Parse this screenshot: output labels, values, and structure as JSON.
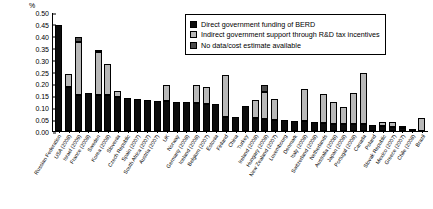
{
  "chart_data": {
    "type": "bar",
    "title": "",
    "xlabel": "",
    "ylabel": "%",
    "ylim": [
      0.0,
      0.5
    ],
    "ytick_labels": [
      "0.50",
      "0.45",
      "0.40",
      "0.35",
      "0.30",
      "0.25",
      "0.20",
      "0.15",
      "0.10",
      "0.05",
      "0.00"
    ],
    "ytick_values": [
      0.5,
      0.45,
      0.4,
      0.35,
      0.3,
      0.25,
      0.2,
      0.15,
      0.1,
      0.05,
      0.0
    ],
    "grid": false,
    "stacked": true,
    "legend_position": "top-right-inside",
    "categories": [
      "Russian Federation",
      "USA (2008)",
      "Israel (2009)",
      "France (2008)",
      "Sweden",
      "Korea (2008)",
      "Slovenia",
      "Czech Republic",
      "Spain (2007)",
      "South Africa (2007)",
      "Austria (2007)",
      "UK",
      "Norway",
      "Germany (2008)",
      "Iceland (2008)",
      "Belgium (2007)",
      "Estonia",
      "Finland",
      "China",
      "Turkey",
      "Ireland (2008)",
      "Hungary (2008)",
      "New Zealand (2007)",
      "Luxembourg",
      "Denmark",
      "Italy (2008)",
      "Switzerland (2008)",
      "Netherlands",
      "Australia (2008)",
      "Japan (2008)",
      "Portugal (2008)",
      "Canada",
      "Poland",
      "Slovak Republic",
      "Mexico (2007)",
      "Greece (2007)",
      "Chile (2008)",
      "Brazil"
    ],
    "series": [
      {
        "name": "Direct government funding of BERD",
        "color": "#0d0d0d",
        "values": [
          0.445,
          0.185,
          0.15,
          0.16,
          0.15,
          0.15,
          0.145,
          0.14,
          0.135,
          0.13,
          0.128,
          0.125,
          0.122,
          0.12,
          0.118,
          0.115,
          0.112,
          0.06,
          0.058,
          0.105,
          0.055,
          0.05,
          0.045,
          0.045,
          0.042,
          0.04,
          0.038,
          0.035,
          0.03,
          0.028,
          0.03,
          0.03,
          0.025,
          0.022,
          0.018,
          0.012,
          0.01,
          0.0
        ]
      },
      {
        "name": "Indirect government support through R&D tax incentives",
        "color": "#b8b8b8",
        "values": [
          0.0,
          0.055,
          0.225,
          0.0,
          0.18,
          0.13,
          0.025,
          0.0,
          0.0,
          0.0,
          0.0,
          0.07,
          0.0,
          0.0,
          0.075,
          0.07,
          0.0,
          0.175,
          0.0,
          0.0,
          0.075,
          0.115,
          0.09,
          0.0,
          0.0,
          0.135,
          0.0,
          0.12,
          0.09,
          0.075,
          0.13,
          0.215,
          0.0,
          0.015,
          0.02,
          0.01,
          0.0,
          0.055
        ]
      },
      {
        "name": "No data/cost estimate available",
        "color": "#4d4d4d",
        "values": [
          0.0,
          0.0,
          0.018,
          0.0,
          0.012,
          0.0,
          0.0,
          0.0,
          0.0,
          0.0,
          0.0,
          0.0,
          0.0,
          0.0,
          0.0,
          0.0,
          0.0,
          0.0,
          0.0,
          0.0,
          0.0,
          0.03,
          0.0,
          0.0,
          0.0,
          0.0,
          0.0,
          0.0,
          0.0,
          0.0,
          0.0,
          0.0,
          0.0,
          0.0,
          0.0,
          0.0,
          0.0,
          0.0
        ]
      }
    ]
  },
  "legend": {
    "items": [
      {
        "label": "Direct government funding of BERD"
      },
      {
        "label": "Indirect government support through R&D tax incentives"
      },
      {
        "label": "No data/cost estimate available"
      }
    ]
  }
}
